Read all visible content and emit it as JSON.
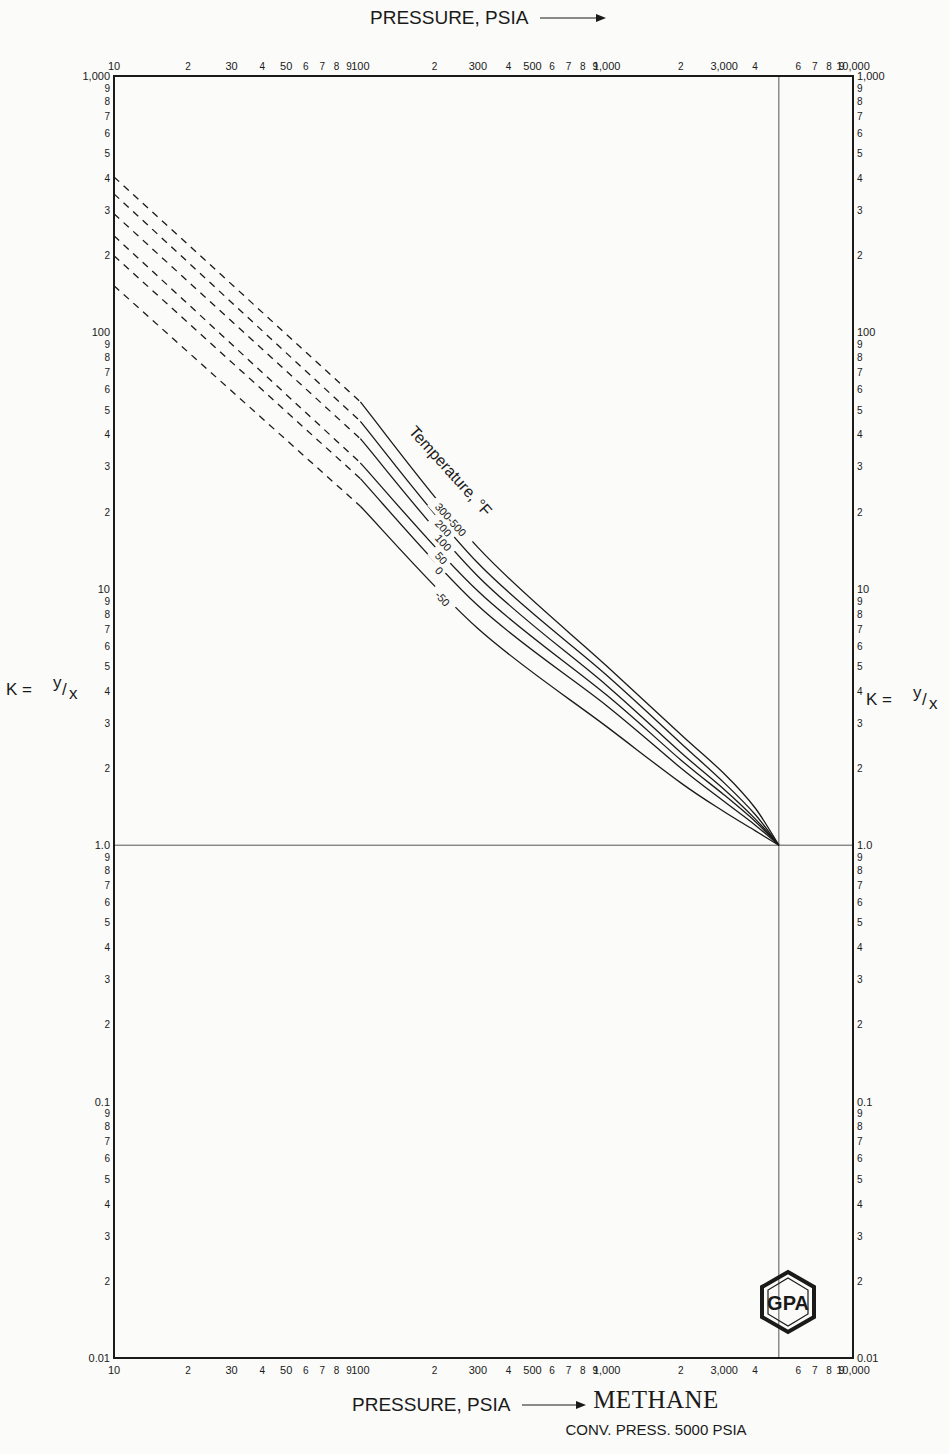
{
  "chart_data": {
    "type": "line",
    "title": "METHANE",
    "subtitle": "CONV. PRESS. 5000 PSIA",
    "xlabel": "PRESSURE, PSIA",
    "ylabel": "K = y/x",
    "xscale": "log",
    "yscale": "log",
    "xlim": [
      10,
      10000
    ],
    "ylim": [
      0.01,
      1000
    ],
    "x_ticks_major": [
      "10",
      "100",
      "1,000",
      "10,000"
    ],
    "x_tick_labels_top": [
      {
        "v": 10,
        "t": "10"
      },
      {
        "v": 20,
        "t": "2"
      },
      {
        "v": 30,
        "t": "30"
      },
      {
        "v": 40,
        "t": "4"
      },
      {
        "v": 50,
        "t": "50"
      },
      {
        "v": 60,
        "t": "6"
      },
      {
        "v": 70,
        "t": "7"
      },
      {
        "v": 80,
        "t": "8"
      },
      {
        "v": 90,
        "t": "9"
      },
      {
        "v": 100,
        "t": "100"
      },
      {
        "v": 200,
        "t": "2"
      },
      {
        "v": 300,
        "t": "300"
      },
      {
        "v": 400,
        "t": "4"
      },
      {
        "v": 500,
        "t": "500"
      },
      {
        "v": 600,
        "t": "6"
      },
      {
        "v": 700,
        "t": "7"
      },
      {
        "v": 800,
        "t": "8"
      },
      {
        "v": 900,
        "t": "9"
      },
      {
        "v": 1000,
        "t": "1,000"
      },
      {
        "v": 2000,
        "t": "2"
      },
      {
        "v": 3000,
        "t": "3,000"
      },
      {
        "v": 4000,
        "t": "4"
      },
      {
        "v": 6000,
        "t": "6"
      },
      {
        "v": 7000,
        "t": "7"
      },
      {
        "v": 8000,
        "t": "8"
      },
      {
        "v": 9000,
        "t": "9"
      },
      {
        "v": 10000,
        "t": "10,000"
      }
    ],
    "y_tick_labels": [
      {
        "v": 1000,
        "t": "1,000"
      },
      {
        "v": 900,
        "t": "9"
      },
      {
        "v": 800,
        "t": "8"
      },
      {
        "v": 700,
        "t": "7"
      },
      {
        "v": 600,
        "t": "6"
      },
      {
        "v": 500,
        "t": "5"
      },
      {
        "v": 400,
        "t": "4"
      },
      {
        "v": 300,
        "t": "3"
      },
      {
        "v": 200,
        "t": "2"
      },
      {
        "v": 100,
        "t": "100"
      },
      {
        "v": 90,
        "t": "9"
      },
      {
        "v": 80,
        "t": "8"
      },
      {
        "v": 70,
        "t": "7"
      },
      {
        "v": 60,
        "t": "6"
      },
      {
        "v": 50,
        "t": "5"
      },
      {
        "v": 40,
        "t": "4"
      },
      {
        "v": 30,
        "t": "3"
      },
      {
        "v": 20,
        "t": "2"
      },
      {
        "v": 10,
        "t": "10"
      },
      {
        "v": 9,
        "t": "9"
      },
      {
        "v": 8,
        "t": "8"
      },
      {
        "v": 7,
        "t": "7"
      },
      {
        "v": 6,
        "t": "6"
      },
      {
        "v": 5,
        "t": "5"
      },
      {
        "v": 4,
        "t": "4"
      },
      {
        "v": 3,
        "t": "3"
      },
      {
        "v": 2,
        "t": "2"
      },
      {
        "v": 1,
        "t": "1.0"
      },
      {
        "v": 0.9,
        "t": "9"
      },
      {
        "v": 0.8,
        "t": "8"
      },
      {
        "v": 0.7,
        "t": "7"
      },
      {
        "v": 0.6,
        "t": "6"
      },
      {
        "v": 0.5,
        "t": "5"
      },
      {
        "v": 0.4,
        "t": "4"
      },
      {
        "v": 0.3,
        "t": "3"
      },
      {
        "v": 0.2,
        "t": "2"
      },
      {
        "v": 0.1,
        "t": "0.1"
      },
      {
        "v": 0.09,
        "t": "9"
      },
      {
        "v": 0.08,
        "t": "8"
      },
      {
        "v": 0.07,
        "t": "7"
      },
      {
        "v": 0.06,
        "t": "6"
      },
      {
        "v": 0.05,
        "t": "5"
      },
      {
        "v": 0.04,
        "t": "4"
      },
      {
        "v": 0.03,
        "t": "3"
      },
      {
        "v": 0.02,
        "t": "2"
      },
      {
        "v": 0.01,
        "t": "0.01"
      }
    ],
    "reference_lines": {
      "k_equals_one": 1.0,
      "convergence_pressure": 5000
    },
    "legend_title": "Temperature, °F",
    "series": [
      {
        "name": "300-500",
        "dashed": [
          [
            10,
            404
          ],
          [
            100,
            53.6
          ]
        ],
        "solid": [
          [
            100,
            53.6
          ],
          [
            300,
            14.5
          ],
          [
            1000,
            5.0
          ],
          [
            2000,
            2.7
          ],
          [
            3000,
            1.9
          ],
          [
            4000,
            1.4
          ],
          [
            5000,
            1.0
          ]
        ]
      },
      {
        "name": "200",
        "dashed": [
          [
            10,
            347
          ],
          [
            100,
            45
          ]
        ],
        "solid": [
          [
            100,
            45
          ],
          [
            300,
            12.6
          ],
          [
            1000,
            4.6
          ],
          [
            2000,
            2.5
          ],
          [
            3000,
            1.75
          ],
          [
            4000,
            1.32
          ],
          [
            5000,
            1.0
          ]
        ]
      },
      {
        "name": "100",
        "dashed": [
          [
            10,
            290
          ],
          [
            100,
            38.5
          ]
        ],
        "solid": [
          [
            100,
            38.5
          ],
          [
            300,
            11.2
          ],
          [
            1000,
            4.2
          ],
          [
            2000,
            2.3
          ],
          [
            3000,
            1.65
          ],
          [
            4000,
            1.27
          ],
          [
            5000,
            1.0
          ]
        ]
      },
      {
        "name": "50",
        "dashed": [
          [
            10,
            238
          ],
          [
            100,
            31
          ]
        ],
        "solid": [
          [
            100,
            31
          ],
          [
            300,
            9.8
          ],
          [
            1000,
            3.85
          ],
          [
            2000,
            2.15
          ],
          [
            3000,
            1.57
          ],
          [
            4000,
            1.24
          ],
          [
            5000,
            1.0
          ]
        ]
      },
      {
        "name": "0",
        "dashed": [
          [
            10,
            199
          ],
          [
            100,
            26.9
          ]
        ],
        "solid": [
          [
            100,
            26.9
          ],
          [
            300,
            8.6
          ],
          [
            1000,
            3.5
          ],
          [
            2000,
            2.0
          ],
          [
            3000,
            1.48
          ],
          [
            4000,
            1.2
          ],
          [
            5000,
            1.0
          ]
        ]
      },
      {
        "name": "-50",
        "dashed": [
          [
            10,
            152
          ],
          [
            100,
            21
          ]
        ],
        "solid": [
          [
            100,
            21
          ],
          [
            300,
            7.0
          ],
          [
            1000,
            2.9
          ],
          [
            2000,
            1.75
          ],
          [
            3000,
            1.35
          ],
          [
            4000,
            1.14
          ],
          [
            5000,
            1.0
          ]
        ]
      }
    ],
    "legend_position": "inline, rotated along curves"
  },
  "header": {
    "axis_title_top": "PRESSURE, PSIA"
  },
  "footer": {
    "axis_title_bottom": "PRESSURE, PSIA",
    "compound": "METHANE",
    "conv_pressure": "CONV. PRESS. 5000  PSIA"
  },
  "y_axis": {
    "label_left": "K = ",
    "label_right": "K = ",
    "ratio_num": "y",
    "ratio_den": "x"
  },
  "logo": {
    "text": "GPA"
  }
}
